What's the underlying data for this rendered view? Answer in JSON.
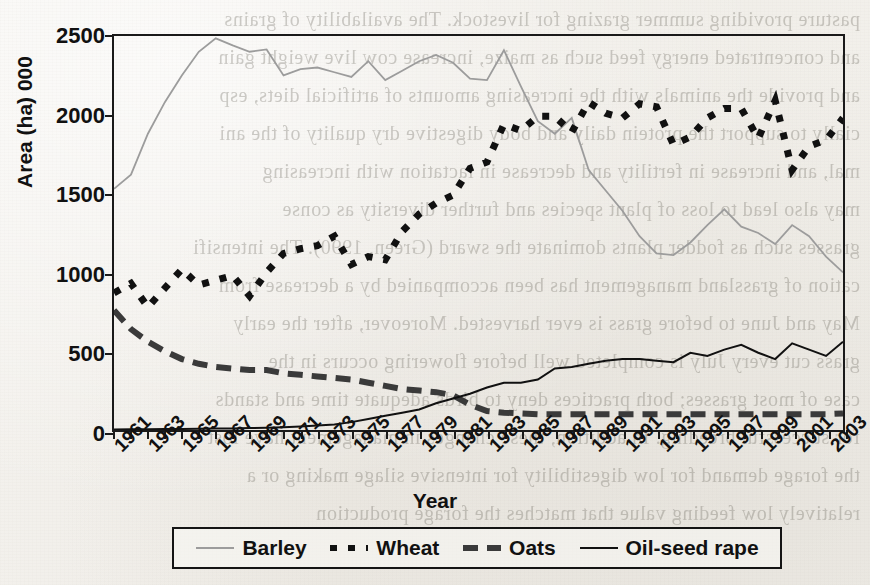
{
  "chart_data": {
    "type": "line",
    "title": "",
    "xlabel": "Year",
    "ylabel": "Area (ha) 000",
    "xlim": [
      1961,
      2004
    ],
    "ylim": [
      0,
      2500
    ],
    "grid": false,
    "legend_position": "bottom",
    "y_ticks": [
      0,
      500,
      1000,
      1500,
      2000,
      2500
    ],
    "x_ticks": [
      1961,
      1963,
      1965,
      1967,
      1969,
      1971,
      1973,
      1975,
      1977,
      1979,
      1981,
      1983,
      1985,
      1987,
      1989,
      1991,
      1993,
      1995,
      1997,
      1999,
      2001,
      2003
    ],
    "x": [
      1961,
      1962,
      1963,
      1964,
      1965,
      1966,
      1967,
      1968,
      1969,
      1970,
      1971,
      1972,
      1973,
      1974,
      1975,
      1976,
      1977,
      1978,
      1979,
      1980,
      1981,
      1982,
      1983,
      1984,
      1985,
      1986,
      1987,
      1988,
      1989,
      1990,
      1991,
      1992,
      1993,
      1994,
      1995,
      1996,
      1997,
      1998,
      1999,
      2000,
      2001,
      2002,
      2003,
      2004
    ],
    "series": [
      {
        "name": "Barley",
        "style": "thin-solid-grey",
        "color": "#9c9c9c",
        "values": [
          1530,
          1620,
          1880,
          2080,
          2250,
          2400,
          2485,
          2440,
          2400,
          2415,
          2250,
          2290,
          2300,
          2270,
          2240,
          2340,
          2220,
          2280,
          2340,
          2380,
          2330,
          2230,
          2220,
          2410,
          2180,
          1960,
          1880,
          1980,
          1650,
          1520,
          1390,
          1230,
          1120,
          1110,
          1190,
          1300,
          1400,
          1290,
          1250,
          1180,
          1300,
          1230,
          1100,
          1000
        ]
      },
      {
        "name": "Wheat",
        "style": "thick-dotted",
        "color": "#111111",
        "values": [
          870,
          930,
          780,
          900,
          1020,
          920,
          950,
          980,
          850,
          1000,
          1120,
          1150,
          1170,
          1230,
          1050,
          1100,
          1080,
          1260,
          1370,
          1440,
          1490,
          1660,
          1700,
          1940,
          1900,
          1990,
          1990,
          1890,
          2080,
          2010,
          1980,
          2070,
          2050,
          1810,
          1860,
          1980,
          2040,
          2040,
          1850,
          2090,
          1650,
          1800,
          1840,
          1980
        ]
      },
      {
        "name": "Oats",
        "style": "thick-dashed",
        "color": "#3a3a3a",
        "values": [
          760,
          640,
          560,
          500,
          450,
          420,
          400,
          390,
          380,
          380,
          360,
          350,
          340,
          330,
          320,
          300,
          280,
          260,
          250,
          240,
          220,
          160,
          120,
          110,
          105,
          100,
          100,
          100,
          100,
          100,
          100,
          100,
          100,
          100,
          100,
          100,
          100,
          100,
          100,
          100,
          100,
          100,
          100,
          105
        ]
      },
      {
        "name": "Oil-seed rape",
        "style": "thin-solid-black",
        "color": "#111111",
        "values": [
          3,
          4,
          5,
          6,
          7,
          8,
          9,
          10,
          12,
          14,
          18,
          22,
          28,
          35,
          50,
          70,
          90,
          110,
          130,
          170,
          200,
          230,
          270,
          300,
          300,
          320,
          390,
          400,
          420,
          440,
          450,
          450,
          440,
          430,
          490,
          470,
          510,
          540,
          490,
          450,
          550,
          510,
          470,
          560
        ]
      }
    ]
  },
  "legend": {
    "entries": [
      {
        "label": "Barley"
      },
      {
        "label": "Wheat"
      },
      {
        "label": "Oats"
      },
      {
        "label": "Oil-seed rape"
      }
    ]
  },
  "bleed_text": [
    "pasture providing summer grazing for livestock. The availability of grains",
    "and concentrated energy feed such as maize, increase cow live weight gain",
    "and provide the animals with the increasing amounts of artificial diets, esp",
    "cially to support the protein daily and body digestive dry quality of the ani",
    "mal, and increase in fertility and decrease in lactation with increasing",
    "may also lead to loss of plant species and further diversity as conse",
    "grasses such as fodder plants dominate the sward (Green, 1990). The intensifi",
    "cation of grassland management has been accompanied by a decrease from",
    "May and June to before grass is ever harvested. Moreover, after the early",
    "grass cut every July is completed well before flowering occurs in the",
    "case of most grasses; both practices deny to birds adequate time and stands",
    "for successful breeding. In addition, these changes in management have lost",
    "the forage demand for low digestibility for intensive silage making or a",
    "relatively low feeding value that matches the forage production"
  ]
}
